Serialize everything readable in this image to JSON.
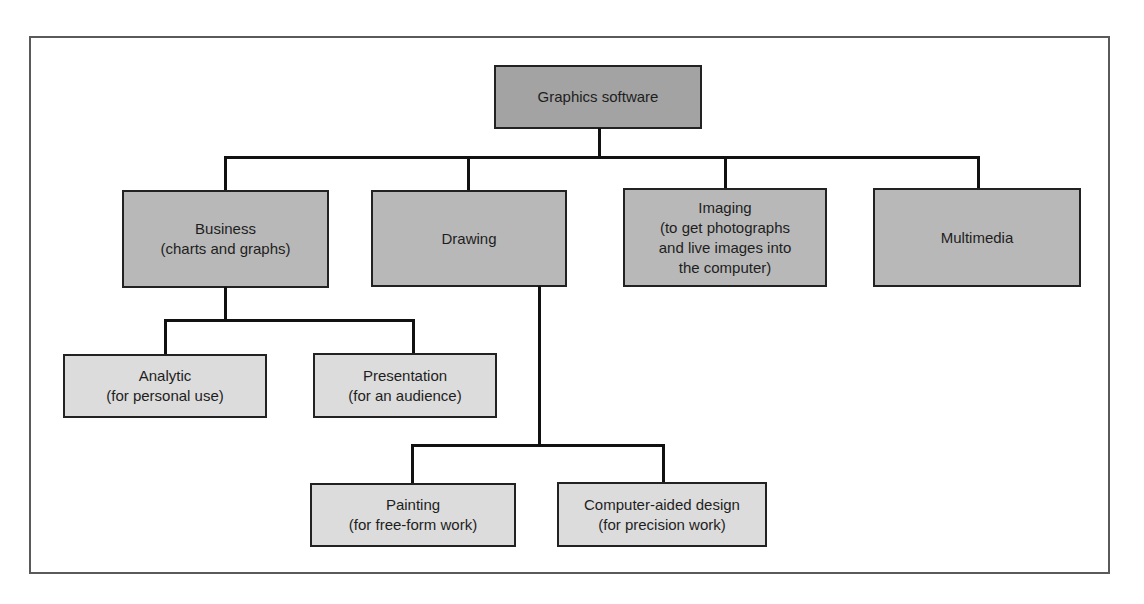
{
  "diagram": {
    "type": "hierarchy",
    "colors": {
      "root_fill": "#a3a3a3",
      "level1_fill": "#b8b8b8",
      "level2_fill": "#dcdcdc",
      "border": "#222222",
      "connector": "#111111",
      "frame": "#5a5a5a"
    },
    "root": {
      "label": "Graphics software"
    },
    "level1": [
      {
        "id": "business",
        "lines": [
          "Business",
          "(charts and graphs)"
        ]
      },
      {
        "id": "drawing",
        "lines": [
          "Drawing"
        ]
      },
      {
        "id": "imaging",
        "lines": [
          "Imaging",
          "(to get photographs",
          "and live images into",
          "the computer)"
        ]
      },
      {
        "id": "multimedia",
        "lines": [
          "Multimedia"
        ]
      }
    ],
    "business_children": [
      {
        "id": "analytic",
        "lines": [
          "Analytic",
          "(for personal use)"
        ]
      },
      {
        "id": "presentation",
        "lines": [
          "Presentation",
          "(for an audience)"
        ]
      }
    ],
    "drawing_children": [
      {
        "id": "painting",
        "lines": [
          "Painting",
          "(for free-form work)"
        ]
      },
      {
        "id": "cad",
        "lines": [
          "Computer-aided design",
          "(for precision work)"
        ]
      }
    ]
  }
}
